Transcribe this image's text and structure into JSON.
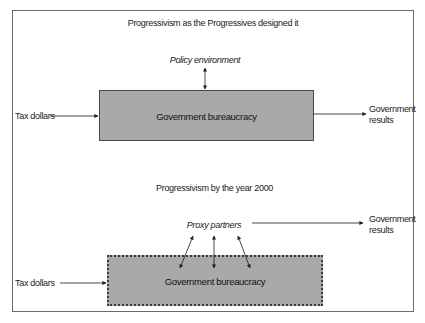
{
  "figure": {
    "top_section": {
      "title": "Progressivism as the Progressives designed it",
      "policy_label": "Policy environment",
      "input_label": "Tax dollars",
      "box_label": "Government bureaucracy",
      "output_label_line1": "Government",
      "output_label_line2": "results"
    },
    "bottom_section": {
      "title": "Progressivism by the year 2000",
      "proxy_label": "Proxy partners",
      "input_label": "Tax dollars",
      "box_label": "Government bureaucracy",
      "output_label_line1": "Government",
      "output_label_line2": "results"
    },
    "colors": {
      "box_fill": "#a9a9a9",
      "frame": "#6a6a6a",
      "arrow": "#1a1a1a"
    }
  }
}
